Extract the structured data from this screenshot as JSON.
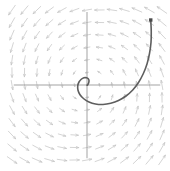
{
  "figure": {
    "width": 170,
    "height": 171,
    "background_color": "#ffffff"
  },
  "colors": {
    "background": "#ffffff",
    "axis": "#999999",
    "field_arrow": "#c6c6c6",
    "trajectory": "#5e5e5e",
    "marker": "#4a4a4a"
  },
  "chart_data": {
    "type": "scatter",
    "subtype": "direction-field-phase-portrait",
    "title": "",
    "subtitle": "",
    "xlabel": "",
    "ylabel": "",
    "xlim": [
      -3,
      3
    ],
    "ylim": [
      -3,
      3
    ],
    "grid": false,
    "legend": null,
    "legend_position": "none",
    "xticks": [],
    "yticks": [],
    "xticklabels": [],
    "yticklabels": [],
    "axes_shown": [
      "x-axis",
      "y-axis"
    ],
    "axis_origin_px": [
      87,
      85
    ],
    "px_per_unit": 25,
    "vector_field": {
      "description": "Counterclockwise rotating direction field of a stable spiral; arrow length grows with distance from origin",
      "grid_nx": 13,
      "grid_ny": 13,
      "x_range": [
        -3,
        3
      ],
      "y_range": [
        -3,
        3
      ],
      "system": {
        "dx": "-0.18*x - 1.0*y",
        "dy": "1.0*x - 0.18*y"
      },
      "rotation": "counterclockwise",
      "equilibrium": [
        0,
        0
      ],
      "equilibrium_type": "stable spiral (attractor)",
      "arrow_color": "#c6c6c6",
      "arrow_max_length_units": 0.46
    },
    "series": [
      {
        "name": "solution trajectory",
        "color": "#5e5e5e",
        "linewidth": 1.6,
        "start_marker": "square",
        "start_point": [
          2.55,
          2.6
        ],
        "end_point": [
          0.0,
          0.0
        ],
        "x": [
          2.55,
          2.57,
          2.56,
          2.5,
          2.4,
          2.25,
          2.06,
          1.83,
          1.56,
          1.26,
          0.95,
          0.64,
          0.34,
          0.08,
          -0.13,
          -0.28,
          -0.36,
          -0.37,
          -0.32,
          -0.23,
          -0.12,
          -0.02,
          0.05,
          0.08,
          0.07,
          0.04,
          0.01,
          0.0
        ],
        "y": [
          2.6,
          2.15,
          1.7,
          1.26,
          0.84,
          0.45,
          0.1,
          -0.2,
          -0.44,
          -0.62,
          -0.73,
          -0.78,
          -0.76,
          -0.68,
          -0.55,
          -0.39,
          -0.21,
          -0.03,
          0.12,
          0.23,
          0.29,
          0.29,
          0.25,
          0.18,
          0.1,
          0.03,
          -0.01,
          0.0
        ]
      }
    ],
    "annotations": []
  }
}
